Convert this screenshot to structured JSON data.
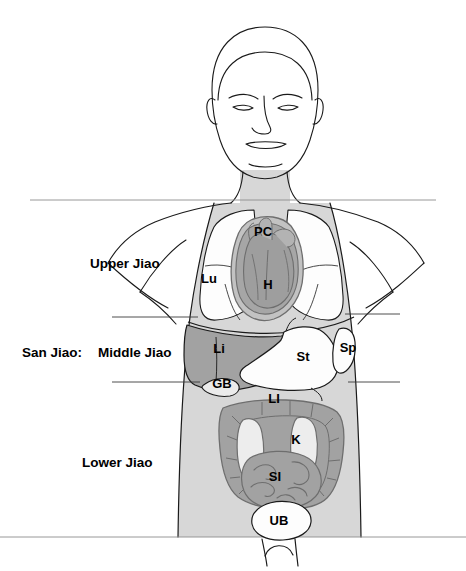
{
  "figure": {
    "background_color": "#ffffff",
    "outline_color": "#1a1a1a",
    "body_fill": "#d7d7d7",
    "organ_dark_fill": "#a2a2a2",
    "organ_light_fill": "#f2f2f2",
    "organ_mid_fill": "#c8c8c8"
  },
  "jiao": {
    "prefix_label": "San Jiao:",
    "divisions": [
      {
        "label": "Upper Jiao",
        "x": 152,
        "y": 264
      },
      {
        "label": "Middle Jiao",
        "x": 152,
        "y": 353
      },
      {
        "label": "Lower Jiao",
        "x": 152,
        "y": 463
      }
    ]
  },
  "organs": [
    {
      "abbr": "PC",
      "name": "pericardium",
      "x": 263,
      "y": 233
    },
    {
      "abbr": "H",
      "name": "heart",
      "x": 268,
      "y": 286
    },
    {
      "abbr": "Lu",
      "name": "lung",
      "x": 209,
      "y": 280
    },
    {
      "abbr": "Li",
      "name": "liver",
      "x": 219,
      "y": 350
    },
    {
      "abbr": "St",
      "name": "stomach",
      "x": 303,
      "y": 358
    },
    {
      "abbr": "Sp",
      "name": "spleen",
      "x": 348,
      "y": 349
    },
    {
      "abbr": "GB",
      "name": "gallbladder",
      "x": 222,
      "y": 385
    },
    {
      "abbr": "LI",
      "name": "large-intestine",
      "x": 274,
      "y": 400
    },
    {
      "abbr": "K",
      "name": "kidney",
      "x": 296,
      "y": 441
    },
    {
      "abbr": "SI",
      "name": "small-intestine",
      "x": 275,
      "y": 478
    },
    {
      "abbr": "UB",
      "name": "urinary-bladder",
      "x": 279,
      "y": 522
    }
  ]
}
